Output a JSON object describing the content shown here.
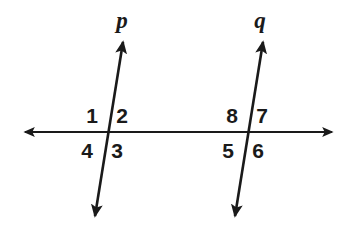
{
  "figure": {
    "width": 355,
    "height": 227,
    "background_color": "#ffffff",
    "stroke_color": "#1a1a1a",
    "text_color": "#1a1a1a"
  },
  "lines": [
    {
      "id": "line-p",
      "label": "p",
      "label_x": 122,
      "label_y": 20,
      "x1": 95,
      "y1": 216,
      "x2": 123,
      "y2": 42,
      "stroke_width": 2.6,
      "arrows": "both"
    },
    {
      "id": "line-q",
      "label": "q",
      "label_x": 260,
      "label_y": 20,
      "x1": 235,
      "y1": 216,
      "x2": 263,
      "y2": 42,
      "stroke_width": 2.6,
      "arrows": "both"
    },
    {
      "id": "transversal-horizontal",
      "label": "",
      "label_x": 0,
      "label_y": 0,
      "x1": 25,
      "y1": 132,
      "x2": 332,
      "y2": 132,
      "stroke_width": 2.2,
      "arrows": "both"
    }
  ],
  "intersections": [
    {
      "id": "intersection-p",
      "x": 108,
      "y": 132
    },
    {
      "id": "intersection-q",
      "x": 248,
      "y": 132
    }
  ],
  "angle_labels": [
    {
      "id": "angle-1",
      "text": "1",
      "x": 92,
      "y": 115,
      "intersection": "intersection-p",
      "quadrant": "upper-left"
    },
    {
      "id": "angle-2",
      "text": "2",
      "x": 122,
      "y": 115,
      "intersection": "intersection-p",
      "quadrant": "upper-right"
    },
    {
      "id": "angle-3",
      "text": "3",
      "x": 117,
      "y": 150,
      "intersection": "intersection-p",
      "quadrant": "lower-right"
    },
    {
      "id": "angle-4",
      "text": "4",
      "x": 87,
      "y": 150,
      "intersection": "intersection-p",
      "quadrant": "lower-left"
    },
    {
      "id": "angle-5",
      "text": "5",
      "x": 228,
      "y": 150,
      "intersection": "intersection-q",
      "quadrant": "lower-left"
    },
    {
      "id": "angle-6",
      "text": "6",
      "x": 258,
      "y": 150,
      "intersection": "intersection-q",
      "quadrant": "lower-right"
    },
    {
      "id": "angle-7",
      "text": "7",
      "x": 262,
      "y": 115,
      "intersection": "intersection-q",
      "quadrant": "upper-right"
    },
    {
      "id": "angle-8",
      "text": "8",
      "x": 232,
      "y": 115,
      "intersection": "intersection-q",
      "quadrant": "upper-left"
    }
  ]
}
